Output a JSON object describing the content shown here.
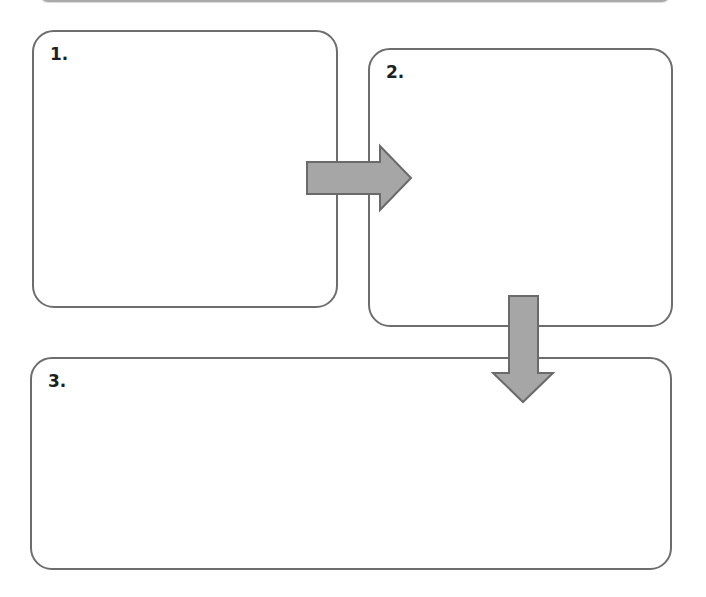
{
  "diagram": {
    "type": "process-flow",
    "steps": [
      {
        "label": "1.",
        "content": ""
      },
      {
        "label": "2.",
        "content": ""
      },
      {
        "label": "3.",
        "content": ""
      }
    ],
    "connectors": [
      {
        "from": "1.",
        "to": "2.",
        "direction": "right"
      },
      {
        "from": "2.",
        "to": "3.",
        "direction": "down"
      }
    ],
    "colors": {
      "box_border": "#6d6d6d",
      "arrow_fill": "#a6a6a6",
      "arrow_stroke": "#6a6a6a",
      "label_text": "#1f1f1f",
      "background": "#ffffff"
    }
  }
}
